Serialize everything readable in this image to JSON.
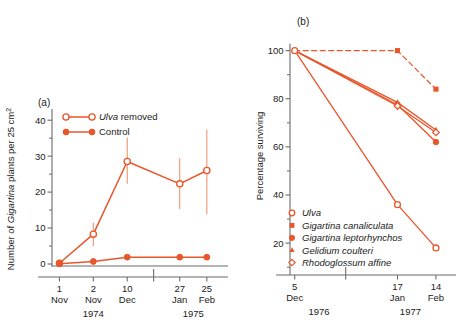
{
  "figure": {
    "background": "#ffffff",
    "accent": "#E8562A",
    "accent_light": "#EE8A63",
    "axis_color": "#6b6b6b"
  },
  "panel_a": {
    "label": "(a)",
    "ylabel_parts": {
      "pre": "Number of ",
      "italic": "Gigartina",
      "post": " plants per 25 cm",
      "sup": "2"
    },
    "ylabel_plain": "Number of Gigartina plants per 25 cm2",
    "legend": [
      {
        "label_italic": "Ulva",
        "label_rest": " removed",
        "marker": "open-circle",
        "key": "ulva-removed"
      },
      {
        "label_italic": "",
        "label_rest": "Control",
        "marker": "filled-circle",
        "key": "control"
      }
    ],
    "yticks": [
      "0",
      "10",
      "20",
      "30",
      "40"
    ],
    "xticks": [
      {
        "day": "1",
        "month": "Nov"
      },
      {
        "day": "2",
        "month": "Nov"
      },
      {
        "day": "10",
        "month": "Dec"
      },
      {
        "day": "27",
        "month": "Jan"
      },
      {
        "day": "25",
        "month": "Feb"
      }
    ],
    "year_left": "1974",
    "year_right": "1975"
  },
  "panel_b": {
    "label": "(b)",
    "ylabel": "Percentage surviving",
    "yticks": [
      "20",
      "40",
      "60",
      "80",
      "100"
    ],
    "xticks": [
      {
        "day": "5",
        "month": "Dec"
      },
      {
        "day": "17",
        "month": "Jan"
      },
      {
        "day": "14",
        "month": "Feb"
      }
    ],
    "year_left": "1976",
    "year_right": "1977",
    "legend": [
      {
        "label": "Ulva",
        "marker": "open-circle"
      },
      {
        "label": "Gigartina canaliculata",
        "marker": "filled-square"
      },
      {
        "label": "Gigartina leptorhynchos",
        "marker": "filled-circle"
      },
      {
        "label": "Gelidium coulteri",
        "marker": "filled-triangle"
      },
      {
        "label": "Rhodoglossum affine",
        "marker": "open-diamond"
      }
    ]
  },
  "chart_data": [
    {
      "type": "line",
      "panel": "a",
      "title": "(a)",
      "xlabel": "",
      "ylabel": "Number of Gigartina plants per 25 cm2",
      "ylim": [
        0,
        42
      ],
      "yticks": [
        0,
        10,
        20,
        30,
        40
      ],
      "grid": false,
      "legend_position": "top-left",
      "x_categories": [
        "1 Nov",
        "2 Nov",
        "10 Dec",
        "27 Jan",
        "25 Feb"
      ],
      "x_positions": [
        0,
        1,
        2,
        3.55,
        4.35
      ],
      "series": [
        {
          "name": "Ulva removed",
          "marker": "open-circle",
          "values": [
            0.2,
            8.3,
            28.5,
            22.3,
            26.0
          ],
          "errors_low": [
            0.2,
            5.0,
            22.3,
            15.3,
            13.9
          ],
          "errors_high": [
            0.2,
            11.5,
            35.2,
            29.4,
            37.4
          ]
        },
        {
          "name": "Control",
          "marker": "filled-circle",
          "values": [
            0.1,
            0.7,
            1.9,
            1.9,
            1.9
          ],
          "errors_low": [
            0.1,
            0.3,
            1.5,
            1.5,
            1.5
          ],
          "errors_high": [
            0.1,
            1.2,
            2.4,
            2.4,
            2.4
          ]
        }
      ]
    },
    {
      "type": "line",
      "panel": "b",
      "title": "(b)",
      "xlabel": "",
      "ylabel": "Percentage surviving",
      "ylim": [
        8,
        104
      ],
      "yticks": [
        20,
        40,
        60,
        80,
        100
      ],
      "grid": false,
      "legend_position": "bottom-left",
      "x_categories": [
        "5 Dec",
        "17 Jan",
        "14 Feb"
      ],
      "x_positions": [
        0,
        2.62,
        3.6
      ],
      "series": [
        {
          "name": "Ulva",
          "marker": "open-circle",
          "dash": false,
          "values": [
            100,
            36,
            18
          ]
        },
        {
          "name": "Gigartina canaliculata",
          "marker": "filled-square",
          "dash": true,
          "values": [
            100,
            100,
            84
          ]
        },
        {
          "name": "Gigartina leptorhynchos",
          "marker": "filled-circle",
          "dash": false,
          "values": [
            100,
            77.5,
            62
          ]
        },
        {
          "name": "Gelidium coulteri",
          "marker": "filled-triangle",
          "dash": false,
          "values": [
            100,
            78.5,
            67
          ]
        },
        {
          "name": "Rhodoglossum affine",
          "marker": "open-diamond",
          "dash": false,
          "values": [
            100,
            77,
            66
          ]
        }
      ]
    }
  ]
}
